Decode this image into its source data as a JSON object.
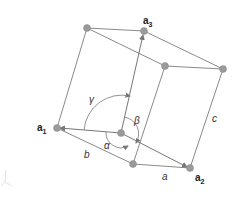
{
  "diagram": {
    "vector_labels": {
      "a1": {
        "base": "a",
        "sub": "1"
      },
      "a2": {
        "base": "a",
        "sub": "2"
      },
      "a3": {
        "base": "a",
        "sub": "3"
      }
    },
    "edge_labels": {
      "a": "a",
      "b": "b",
      "c": "c"
    },
    "angle_labels": {
      "alpha": "α",
      "beta": "β",
      "gamma": "γ"
    },
    "colors": {
      "edge": "#8a8a8a",
      "atom": "#9a9a9a",
      "text": "#222222"
    }
  }
}
